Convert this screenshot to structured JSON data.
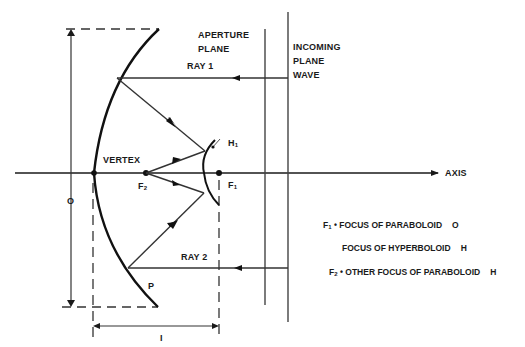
{
  "diagram": {
    "labels": {
      "aperture_plane_line1": "APERTURE",
      "aperture_plane_line2": "PLANE",
      "incoming_line1": "INCOMING",
      "incoming_line2": "PLANE",
      "incoming_line3": "WAVE",
      "ray1": "RAY  1",
      "ray2": "RAY  2",
      "vertex": "VERTEX",
      "axis": "AXIS",
      "h1": "H",
      "h1_sub": "1",
      "f1": "F",
      "f1_sub": "1",
      "f2": "F",
      "f2_sub": "2",
      "p": "P",
      "dim_o": "O",
      "dim_i": "I"
    },
    "legend": [
      {
        "symbol": "F",
        "sub": "1",
        "sep": "•",
        "text": "FOCUS  OF  PARABOLOID",
        "tag": "O"
      },
      {
        "symbol": "",
        "sub": "",
        "sep": "",
        "text": "FOCUS  OF  HYPERBOLOID",
        "tag": "H"
      },
      {
        "symbol": "F",
        "sub": "2",
        "sep": "•",
        "text": "OTHER  FOCUS  OF  PARABOLOID",
        "tag": "H"
      }
    ],
    "colors": {
      "stroke": "#1a1a1a",
      "ray": "#333333",
      "background": "#ffffff"
    }
  }
}
